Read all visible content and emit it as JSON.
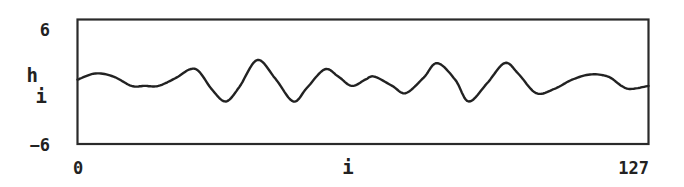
{
  "chart_data": {
    "type": "line",
    "title": "",
    "xlabel": "i",
    "ylabel": "h",
    "ylabel_subscript": "i",
    "xlim": [
      0,
      127
    ],
    "ylim": [
      -6,
      6
    ],
    "x_ticks": [
      "0",
      "127"
    ],
    "y_ticks": [
      "6",
      "-6"
    ],
    "grid": false,
    "legend": null,
    "line_color": "#222222",
    "series": [
      {
        "name": "h_i",
        "x": [
          0,
          4,
          8,
          12,
          15,
          18,
          22,
          25,
          27,
          30,
          33,
          36,
          40,
          44,
          48,
          51,
          55,
          58,
          61,
          64,
          66,
          70,
          73,
          77,
          80,
          84,
          87,
          91,
          95,
          98,
          102,
          106,
          110,
          114,
          118,
          121,
          123,
          127
        ],
        "values": [
          0.2,
          0.8,
          0.5,
          -0.4,
          -0.4,
          -0.4,
          0.4,
          1.2,
          1.0,
          -0.8,
          -1.9,
          -0.5,
          2.1,
          0.3,
          -1.9,
          -0.6,
          1.2,
          0.5,
          -0.4,
          0.2,
          0.5,
          -0.4,
          -1.1,
          0.4,
          1.8,
          0.2,
          -1.9,
          -0.2,
          1.8,
          0.8,
          -1.1,
          -0.7,
          0.2,
          0.7,
          0.5,
          -0.4,
          -0.7,
          -0.4
        ]
      }
    ]
  },
  "labels": {
    "y_top": "6",
    "y_bottom": "−6",
    "y_axis_main": "h",
    "y_axis_sub": "i",
    "x_left": "0",
    "x_mid": "i",
    "x_right": "127"
  }
}
